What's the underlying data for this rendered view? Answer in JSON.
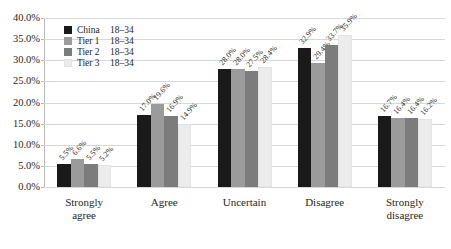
{
  "chart_data": {
    "type": "bar",
    "title": "",
    "subtitle": "",
    "xlabel": "",
    "ylabel": "",
    "categories": [
      "Strongly agree",
      "Agree",
      "Uncertain",
      "Disagree",
      "Strongly disagree"
    ],
    "category_lines": [
      [
        "Strongly",
        "agree"
      ],
      [
        "Agree"
      ],
      [
        "Uncertain"
      ],
      [
        "Disagree"
      ],
      [
        "Strongly",
        "disagree"
      ]
    ],
    "series": [
      {
        "name": "China 18–34",
        "group": "China",
        "age": "18–34",
        "color": "#1a1a1a",
        "values": [
          5.5,
          17.0,
          28.0,
          32.9,
          16.7
        ],
        "labels": [
          "5.5%",
          "17.0%",
          "28.0%",
          "32.9%",
          "16.7%"
        ]
      },
      {
        "name": "Tier 1 18–34",
        "group": "Tier 1",
        "age": "18–34",
        "color": "#9b9b9b",
        "values": [
          6.6,
          19.6,
          28.0,
          29.4,
          16.4
        ],
        "labels": [
          "6.6%",
          "19.6%",
          "28.0%",
          "29.4%",
          "16.4%"
        ]
      },
      {
        "name": "Tier 2 18–34",
        "group": "Tier 2",
        "age": "18–34",
        "color": "#7c7c7c",
        "values": [
          5.5,
          16.9,
          27.5,
          33.7,
          16.4
        ],
        "labels": [
          "5.5%",
          "16.9%",
          "27.5%",
          "33.7%",
          "16.4%"
        ]
      },
      {
        "name": "Tier 3 18–34",
        "group": "Tier 3",
        "age": "18–34",
        "color": "#ececec",
        "values": [
          5.2,
          14.9,
          28.4,
          35.9,
          16.2
        ],
        "labels": [
          "5.2%",
          "14.9%",
          "28.4%",
          "35.9%",
          "16.2%"
        ]
      }
    ],
    "ylim": [
      0,
      40
    ],
    "ytick_step": 5,
    "ytick_labels": [
      "0.0%",
      "5.0%",
      "10.0%",
      "15.0%",
      "20.0%",
      "25.0%",
      "30.0%",
      "35.0%",
      "40.0%"
    ],
    "grid": true,
    "grid_color": "#d8d8d8",
    "legend_position": "top-left",
    "value_label_rotation": -48
  }
}
